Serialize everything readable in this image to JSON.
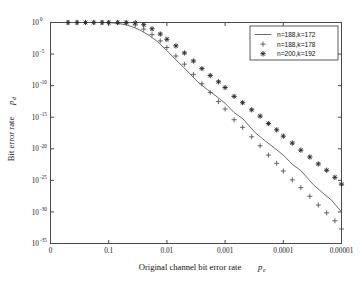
{
  "chart_data": {
    "type": "line",
    "title": "",
    "xlabel": "Original channel bit error rate",
    "xlabel_symbol": "p",
    "xlabel_symbol_sub": "e",
    "ylabel": "Bit error rate",
    "ylabel_symbol": "p",
    "ylabel_symbol_sub": "d",
    "xscale": "log-reversed",
    "yscale": "log",
    "xlim": [
      1,
      1e-05
    ],
    "ylim": [
      1e-35,
      1
    ],
    "grid": false,
    "x_ticks": [
      "0",
      "0.1",
      "0.01",
      "0.001",
      "0.0001",
      "0.00001"
    ],
    "x_tick_values": [
      1,
      0.1,
      0.01,
      0.001,
      0.0001,
      1e-05
    ],
    "y_ticks": [
      "10^0",
      "10^-5",
      "10^-10",
      "10^-15",
      "10^-20",
      "10^-25",
      "10^-30",
      "10^-35"
    ],
    "y_tick_mantissa": "10",
    "y_tick_exponents": [
      "0",
      "-5",
      "-10",
      "-15",
      "-20",
      "-25",
      "-30",
      "-35"
    ],
    "y_tick_values": [
      1,
      1e-05,
      1e-10,
      1e-15,
      1e-20,
      1e-25,
      1e-30,
      1e-35
    ],
    "legend_position": "top-right",
    "series": [
      {
        "name": "n=188,k=172",
        "marker": "line",
        "style": "solid-line",
        "x": [
          0.5,
          0.3,
          0.2,
          0.15,
          0.1,
          0.07,
          0.05,
          0.04,
          0.03,
          0.02,
          0.015,
          0.01,
          0.007,
          0.005,
          0.003,
          0.002,
          0.0015,
          0.001,
          0.0007,
          0.0005,
          0.0003,
          0.0002,
          0.00015,
          0.0001,
          7e-05,
          5e-05,
          3e-05,
          2e-05,
          1.5e-05,
          1e-05
        ],
        "y": [
          1,
          1,
          1,
          0.99,
          0.95,
          0.75,
          0.42,
          0.22,
          0.075,
          0.0085,
          0.0012,
          3.5e-05,
          1.2e-06,
          6e-08,
          4.5e-10,
          2.2e-11,
          3.2e-12,
          1.6e-13,
          5.5e-15,
          6e-16,
          3.2e-18,
          1.5e-19,
          2e-20,
          1e-21,
          3.5e-23,
          3.5e-24,
          1.8e-26,
          7e-28,
          8e-29,
          1e-30
        ]
      },
      {
        "name": "n=188,k=178",
        "marker": "plus",
        "style": "markers",
        "x": [
          0.5,
          0.35,
          0.25,
          0.18,
          0.13,
          0.1,
          0.07,
          0.05,
          0.035,
          0.025,
          0.018,
          0.013,
          0.01,
          0.007,
          0.005,
          0.0035,
          0.0025,
          0.0018,
          0.0013,
          0.001,
          0.0007,
          0.0005,
          0.00035,
          0.00025,
          0.00018,
          0.00013,
          0.0001,
          7e-05,
          5e-05,
          3.5e-05,
          2.5e-05,
          1.8e-05,
          1.3e-05,
          1e-05
        ],
        "y": [
          1,
          1,
          1,
          1,
          1,
          1,
          0.98,
          0.85,
          0.4,
          0.09,
          0.012,
          0.0012,
          0.00011,
          5e-06,
          2.5e-07,
          6e-09,
          2e-10,
          8e-12,
          3e-13,
          2e-14,
          4e-16,
          2.5e-17,
          8e-19,
          3e-20,
          1e-21,
          5e-23,
          3e-24,
          1.2e-25,
          7e-27,
          3e-28,
          1.2e-29,
          7e-31,
          4e-32,
          2e-33
        ]
      },
      {
        "name": "n=200,k=192",
        "marker": "star",
        "style": "markers",
        "x": [
          0.5,
          0.35,
          0.25,
          0.18,
          0.13,
          0.1,
          0.07,
          0.05,
          0.035,
          0.025,
          0.018,
          0.013,
          0.01,
          0.007,
          0.005,
          0.0035,
          0.0025,
          0.0018,
          0.0013,
          0.001,
          0.0007,
          0.0005,
          0.00035,
          0.00025,
          0.00018,
          0.00013,
          0.0001,
          7e-05,
          5e-05,
          3.5e-05,
          2.5e-05,
          1.8e-05,
          1.3e-05,
          1e-05
        ],
        "y": [
          1,
          1,
          1,
          1,
          1,
          1,
          1,
          0.99,
          0.9,
          0.45,
          0.1,
          0.015,
          0.0022,
          0.0002,
          1.5e-05,
          8e-07,
          5e-08,
          4e-09,
          4e-10,
          5e-11,
          2e-12,
          2e-13,
          1.5e-14,
          1.5e-15,
          1e-16,
          1e-17,
          1e-18,
          8e-20,
          6e-21,
          5e-22,
          4e-23,
          4e-24,
          3e-25,
          2.5e-26
        ]
      }
    ]
  },
  "legend": {
    "entries": [
      {
        "label": "n=188,k=172",
        "marker": "line"
      },
      {
        "label": "n=188,k=178",
        "marker": "plus"
      },
      {
        "label": "n=200,k=192",
        "marker": "star"
      }
    ]
  }
}
